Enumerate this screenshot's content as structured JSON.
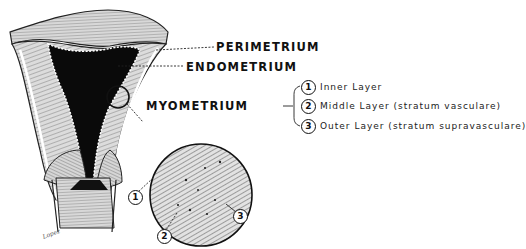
{
  "diagram": {
    "labels": {
      "perimetrium": "PERIMETRIUM",
      "endometrium": "ENDOMETRIUM",
      "myometrium": "MYOMETRIUM"
    },
    "myometrium_layers": [
      {
        "number": "1",
        "text": "Inner Layer"
      },
      {
        "number": "2",
        "text": "Middle Layer (stratum vasculare)"
      },
      {
        "number": "3",
        "text": "Outer Layer (stratum supravasculare)"
      }
    ],
    "magnified_view_callouts": [
      "1",
      "2",
      "3"
    ],
    "signature": "Lopez",
    "colors": {
      "ink": "#111111",
      "background": "#ffffff",
      "tissue_fill": "#cfcfcf",
      "cavity_fill": "#0a0a0a"
    }
  }
}
